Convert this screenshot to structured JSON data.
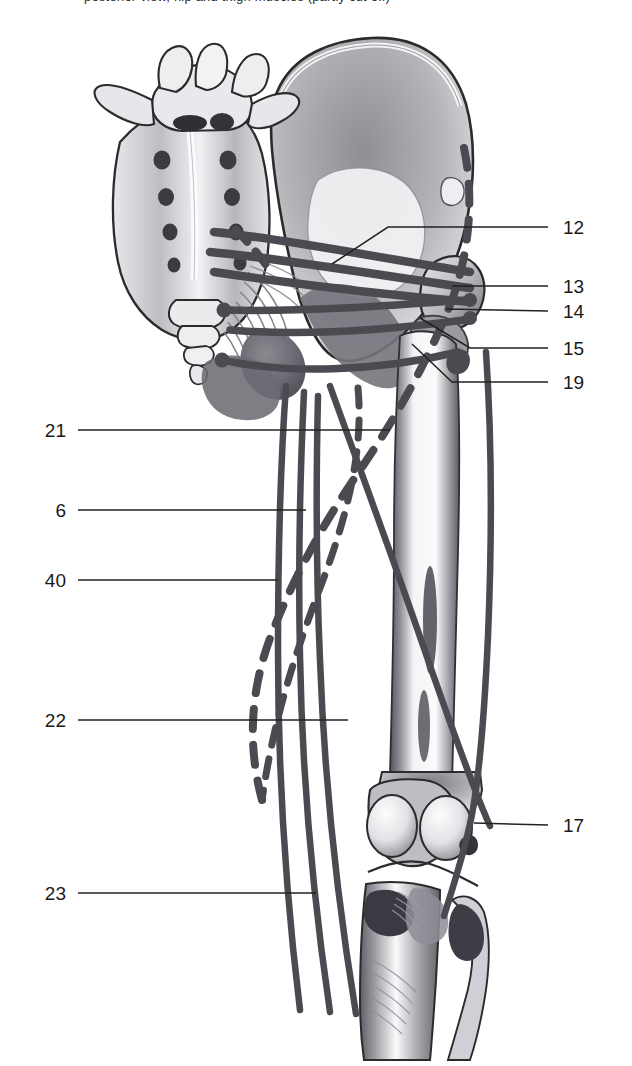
{
  "figure": {
    "kind": "anatomical-line-drawing",
    "view": "posterior view of right hip, thigh and knee with muscle course lines",
    "cropped_caption_fragment": "posterior view, hip and thigh muscles (partly cut off)",
    "bone_structures": [
      "sacrum",
      "coccyx",
      "fifth lumbar vertebra",
      "ilium (hip bone)",
      "ischium",
      "ischial tuberosity",
      "greater trochanter",
      "femur shaft",
      "femoral condyles",
      "patella (dark ovals)",
      "tibia",
      "fibula"
    ],
    "line_styles": {
      "muscle_solid": "solid dark-grey band = muscle course shown in full",
      "muscle_dashed": "dashed dark-grey band = muscle course hidden behind bone",
      "leader": "thin black line = label leader"
    }
  },
  "labels": {
    "right": [
      {
        "id": "12",
        "text": "12",
        "x": 563,
        "y": 227
      },
      {
        "id": "13",
        "text": "13",
        "x": 563,
        "y": 286
      },
      {
        "id": "14",
        "text": "14",
        "x": 563,
        "y": 311
      },
      {
        "id": "15",
        "text": "15",
        "x": 563,
        "y": 348
      },
      {
        "id": "19",
        "text": "19",
        "x": 563,
        "y": 382
      },
      {
        "id": "17",
        "text": "17",
        "x": 563,
        "y": 825
      }
    ],
    "left": [
      {
        "id": "21",
        "text": "21",
        "x": 52,
        "y": 430
      },
      {
        "id": "6",
        "text": "6",
        "x": 58,
        "y": 510
      },
      {
        "id": "40",
        "text": "40",
        "x": 52,
        "y": 580
      },
      {
        "id": "22",
        "text": "22",
        "x": 52,
        "y": 720
      },
      {
        "id": "23",
        "text": "23",
        "x": 52,
        "y": 893
      }
    ]
  },
  "colors": {
    "ink": "#1a1a1a",
    "leader": "#222222",
    "muscle": "#4a4a50",
    "bone_outline": "#2b2b2b",
    "bone_shade_dark": "#6f6f74",
    "bone_shade_mid": "#a8a8ad",
    "bone_shade_light": "#d8d8dc",
    "background": "#ffffff"
  }
}
